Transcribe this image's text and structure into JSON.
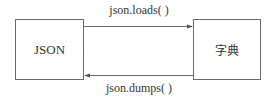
{
  "diagram": {
    "nodes": [
      {
        "id": "json",
        "label": "JSON"
      },
      {
        "id": "dict",
        "label": "字典"
      }
    ],
    "edges": [
      {
        "from": "json",
        "to": "dict",
        "label": "json.loads( )"
      },
      {
        "from": "dict",
        "to": "json",
        "label": "json.dumps( )"
      }
    ],
    "colors": {
      "line": "#6a6a6a",
      "text": "#333333",
      "background": "#ffffff"
    }
  }
}
